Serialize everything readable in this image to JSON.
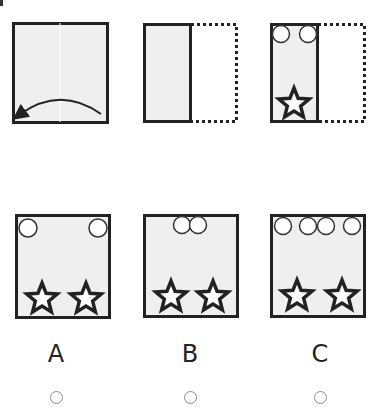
{
  "puzzle": {
    "steps": [
      {
        "id": "step-1",
        "description": "square sheet folded from right to left along vertical center line",
        "folded": false,
        "arrow": "fold-right-to-left"
      },
      {
        "id": "step-2",
        "description": "sheet folded in half; right half shown dotted",
        "folded": true,
        "circles": 0,
        "stars": 0
      },
      {
        "id": "step-3",
        "description": "folded sheet with two holes punched at top and one star at bottom",
        "folded": true,
        "circles": 2,
        "stars": 1
      }
    ],
    "options": [
      {
        "label": "A",
        "top_circles": "two circles at the far corners",
        "circles": 2,
        "stars": 2,
        "selected": false
      },
      {
        "label": "B",
        "top_circles": "two overlapping circles at the center",
        "circles": 2,
        "stars": 2,
        "selected": false
      },
      {
        "label": "C",
        "top_circles": "four circles across the top",
        "circles": 4,
        "stars": 2,
        "selected": false
      }
    ]
  },
  "colors": {
    "paper_fill": "#efefef",
    "outline": "#222222",
    "dotted": "#222222"
  }
}
